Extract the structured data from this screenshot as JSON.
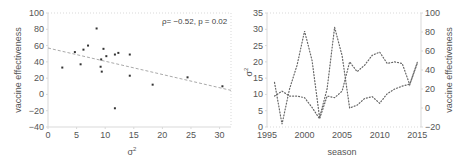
{
  "chart_data": [
    {
      "id": "left",
      "type": "scatter",
      "title": "",
      "xlabel": "σ²",
      "ylabel": "vaccine effectiveness",
      "xlim": [
        0,
        32
      ],
      "ylim": [
        -40,
        100
      ],
      "xticks": [
        0,
        5,
        10,
        15,
        20,
        25,
        30
      ],
      "yticks": [
        -40,
        -20,
        0,
        20,
        40,
        60,
        80,
        100
      ],
      "grid": false,
      "annotation": "ρ= −0.52, p = 0.02",
      "points": [
        {
          "x": 2.5,
          "y": 33
        },
        {
          "x": 4.7,
          "y": 52
        },
        {
          "x": 5.7,
          "y": 37
        },
        {
          "x": 6.2,
          "y": 55
        },
        {
          "x": 7.0,
          "y": 60
        },
        {
          "x": 8.5,
          "y": 81
        },
        {
          "x": 9.2,
          "y": 34
        },
        {
          "x": 9.3,
          "y": 43
        },
        {
          "x": 9.4,
          "y": 28
        },
        {
          "x": 9.7,
          "y": 56
        },
        {
          "x": 10.2,
          "y": 47
        },
        {
          "x": 11.7,
          "y": 49
        },
        {
          "x": 11.7,
          "y": -17
        },
        {
          "x": 12.3,
          "y": 51
        },
        {
          "x": 14.3,
          "y": 49
        },
        {
          "x": 14.3,
          "y": 23
        },
        {
          "x": 18.3,
          "y": 12
        },
        {
          "x": 24.4,
          "y": 21
        },
        {
          "x": 30.5,
          "y": 10
        }
      ],
      "trendline": {
        "x": [
          0,
          32
        ],
        "y": [
          57,
          5
        ],
        "style": "dashed"
      }
    },
    {
      "id": "right",
      "type": "line",
      "title": "",
      "xlabel": "season",
      "ylabel_left": "σ²",
      "ylabel_right": "vaccine effectiveness",
      "xlim": [
        1995,
        2015.5
      ],
      "ylim_left": [
        0,
        35
      ],
      "ylim_right": [
        -20,
        100
      ],
      "xticks": [
        1995,
        2000,
        2005,
        2010,
        2015
      ],
      "yticks_left": [
        0,
        5,
        10,
        15,
        20,
        25,
        30,
        35
      ],
      "yticks_right": [
        -20,
        0,
        20,
        40,
        60,
        80,
        100
      ],
      "grid": false,
      "x": [
        1996,
        1997,
        1998,
        1999,
        2000,
        2001,
        2002,
        2003,
        2004,
        2005,
        2006,
        2007,
        2008,
        2009,
        2010,
        2011,
        2012,
        2013,
        2014,
        2015
      ],
      "series": [
        {
          "name": "σ²",
          "axis": "left",
          "style": "dotted",
          "values": [
            9.5,
            11,
            9.5,
            9.5,
            9,
            6,
            2.5,
            9.5,
            9,
            11,
            20,
            17,
            19,
            22,
            23,
            19.5,
            20,
            19.5,
            13,
            19.5
          ]
        },
        {
          "name": "vaccine effectiveness",
          "axis": "right",
          "style": "dotted",
          "values": [
            27,
            -17,
            20,
            45,
            81,
            50,
            -10,
            20,
            85,
            55,
            0,
            3,
            10,
            12,
            5,
            15,
            20,
            23,
            25,
            48
          ]
        }
      ]
    }
  ],
  "labels": {
    "left_ylabel": "vaccine effectiveness",
    "left_xlabel": "σ",
    "left_xlabel_sup": "2",
    "left_annotation": "ρ= −0.52, p = 0.02",
    "right_xlabel": "season",
    "right_ylabel_left": "σ",
    "right_ylabel_left_sup": "2",
    "right_ylabel_right": "vaccine effectiveness"
  },
  "colors": {
    "axis": "#d9d9d9",
    "tick_text": "#555555",
    "point": "#333333",
    "trendline": "#aaaaaa",
    "series": "#666666"
  }
}
